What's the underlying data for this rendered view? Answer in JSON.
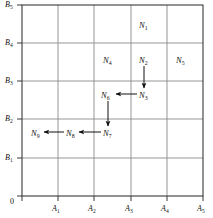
{
  "figure": {
    "type": "grid-diagram",
    "background_color": "#ffffff",
    "frame_color": "#3a3a3a",
    "grid_color": "#8a8a8a",
    "arrow_color": "#111111",
    "text_color": "#111111",
    "plot": {
      "left": 22,
      "top": 5,
      "right": 203,
      "bottom": 196
    },
    "columns": 5,
    "rows": 5
  },
  "axes": {
    "origin_label": "0",
    "x_axis": {
      "name": "x-axis",
      "ticks": [
        {
          "label": "A",
          "sub": "1",
          "x": 58
        },
        {
          "label": "A",
          "sub": "2",
          "x": 94
        },
        {
          "label": "A",
          "sub": "3",
          "x": 131
        },
        {
          "label": "A",
          "sub": "4",
          "x": 167
        },
        {
          "label": "A",
          "sub": "5",
          "x": 203
        }
      ]
    },
    "y_axis": {
      "name": "y-axis",
      "ticks": [
        {
          "label": "B",
          "sub": "5",
          "y": 5
        },
        {
          "label": "B",
          "sub": "4",
          "y": 43
        },
        {
          "label": "B",
          "sub": "3",
          "y": 81
        },
        {
          "label": "B",
          "sub": "2",
          "y": 119
        },
        {
          "label": "B",
          "sub": "1",
          "y": 158
        }
      ]
    }
  },
  "gridlines": {
    "vertical_x": [
      22,
      58,
      94,
      131,
      167,
      203
    ],
    "horizontal_y": [
      5,
      43,
      81,
      119,
      158,
      196
    ]
  },
  "nodes": [
    {
      "id": "N1",
      "label": "N",
      "sub": "1",
      "x": 144,
      "y": 25
    },
    {
      "id": "N2",
      "label": "N",
      "sub": "2",
      "x": 144,
      "y": 60
    },
    {
      "id": "N3",
      "label": "N",
      "sub": "3",
      "x": 144,
      "y": 95
    },
    {
      "id": "N4",
      "label": "N",
      "sub": "4",
      "x": 108,
      "y": 60
    },
    {
      "id": "N5",
      "label": "N",
      "sub": "5",
      "x": 181,
      "y": 60
    },
    {
      "id": "N6",
      "label": "N",
      "sub": "6",
      "x": 108,
      "y": 95
    },
    {
      "id": "N7",
      "label": "N",
      "sub": "7",
      "x": 108,
      "y": 133
    },
    {
      "id": "N8",
      "label": "N",
      "sub": "8",
      "x": 71,
      "y": 133
    },
    {
      "id": "N9",
      "label": "N",
      "sub": "9",
      "x": 36,
      "y": 133
    }
  ],
  "arrows": [
    {
      "name": "arrow-n2-to-n3",
      "from": "N2",
      "to": "N3",
      "direction": "down",
      "x1": 144,
      "y1": 66,
      "x2": 144,
      "y2": 88
    },
    {
      "name": "arrow-n3-to-n6",
      "from": "N3",
      "to": "N6",
      "direction": "left",
      "x1": 137,
      "y1": 94,
      "x2": 116,
      "y2": 94
    },
    {
      "name": "arrow-n6-to-n7",
      "from": "N6",
      "to": "N7",
      "direction": "down",
      "x1": 108,
      "y1": 101,
      "x2": 108,
      "y2": 126
    },
    {
      "name": "arrow-n7-to-n8",
      "from": "N7",
      "to": "N8",
      "direction": "left",
      "x1": 101,
      "y1": 132,
      "x2": 79,
      "y2": 132
    },
    {
      "name": "arrow-n8-to-n9",
      "from": "N8",
      "to": "N9",
      "direction": "left",
      "x1": 64,
      "y1": 132,
      "x2": 44,
      "y2": 132
    }
  ]
}
